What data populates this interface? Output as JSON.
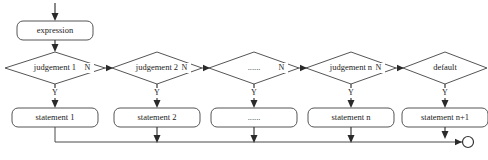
{
  "diagram": {
    "colors": {
      "background": "#ffffff",
      "shape_stroke": "#555555",
      "shape_fill": "#ffffff",
      "line": "#3a3a3a",
      "text": "#1a1a1a"
    },
    "entry": {
      "name": "entry-arrow",
      "label": ""
    },
    "expression": {
      "label": "expression"
    },
    "decisions": [
      {
        "label": "judgement 1",
        "yes_label": "Y",
        "no_label": "N"
      },
      {
        "label": "judgement 2",
        "yes_label": "Y",
        "no_label": "N"
      },
      {
        "label": "......",
        "yes_label": "Y",
        "no_label": "N"
      },
      {
        "label": "judgement n",
        "yes_label": "Y",
        "no_label": "N"
      },
      {
        "label": "default",
        "yes_label": "Y",
        "no_label": ""
      }
    ],
    "statements": [
      {
        "label": "statement 1"
      },
      {
        "label": "statement 2"
      },
      {
        "label": "......"
      },
      {
        "label": "statement n"
      },
      {
        "label": "statement n+1"
      }
    ],
    "merge": {
      "label": "merge-node"
    }
  }
}
